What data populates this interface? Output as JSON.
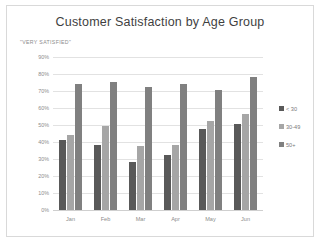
{
  "chart_data": {
    "type": "bar",
    "title": "Customer Satisfaction by Age Group",
    "subtitle": "\"VERY SATISFIED\"",
    "xlabel": "",
    "ylabel": "",
    "ylim": [
      0,
      90
    ],
    "ytick_step": 10,
    "grid": true,
    "legend_position": "right",
    "categories": [
      "Jan",
      "Feb",
      "Mar",
      "Apr",
      "May",
      "Jun"
    ],
    "ytick_labels": [
      "0%",
      "10%",
      "20%",
      "30%",
      "40%",
      "50%",
      "60%",
      "70%",
      "80%",
      "90%"
    ],
    "ytick_values": [
      0,
      10,
      20,
      30,
      40,
      50,
      60,
      70,
      80,
      90
    ],
    "series": [
      {
        "name": "< 30",
        "color": "#595959",
        "values": [
          42,
          39,
          29,
          33,
          48,
          51
        ]
      },
      {
        "name": "30-49",
        "color": "#a6a6a6",
        "values": [
          45,
          50,
          38,
          39,
          53,
          57
        ]
      },
      {
        "name": "50+",
        "color": "#808080",
        "values": [
          75,
          76,
          73,
          75,
          71,
          79
        ]
      }
    ]
  },
  "frame": {
    "border_color": "#d9d9d9",
    "background": "#ffffff"
  }
}
